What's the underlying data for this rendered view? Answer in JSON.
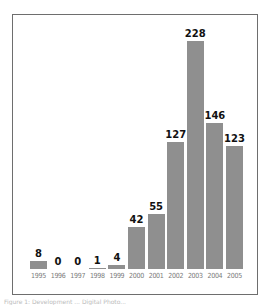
{
  "chart_data": {
    "type": "bar",
    "title": "",
    "xlabel": "",
    "ylabel": "",
    "categories": [
      "1995",
      "1996",
      "1997",
      "1998",
      "1999",
      "2000",
      "2001",
      "2002",
      "2003",
      "2004",
      "2005"
    ],
    "values": [
      8,
      0,
      0,
      1,
      4,
      42,
      55,
      127,
      228,
      146,
      123
    ],
    "ylim": [
      0,
      240
    ],
    "grid": false,
    "legend": null,
    "bar_color": "#8f8f8f",
    "data_labels": true
  },
  "caption": "Figure 1: Development ... Digital Photo..."
}
